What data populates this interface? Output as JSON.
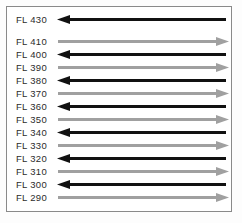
{
  "figure": {
    "name": "flight-level-direction-diagram",
    "frame_border_color": "#8a8a8a",
    "background_color": "#ffffff"
  },
  "colors": {
    "westbound_black": "#111111",
    "eastbound_gray": "#a0a0a0",
    "label_text": "#2b2b2b"
  },
  "legend": {
    "black_arrow_meaning": "arrow-pointing-left",
    "gray_arrow_meaning": "arrow-pointing-right"
  },
  "chart_data": {
    "type": "diagram",
    "title": "",
    "xlabel": "",
    "ylabel": "",
    "rows": [
      {
        "label": "FL 430",
        "direction": "left",
        "color": "#111111",
        "gap_below": true
      },
      {
        "label": "FL 410",
        "direction": "right",
        "color": "#a0a0a0",
        "gap_below": false
      },
      {
        "label": "FL 400",
        "direction": "left",
        "color": "#111111",
        "gap_below": false
      },
      {
        "label": "FL 390",
        "direction": "right",
        "color": "#a0a0a0",
        "gap_below": false
      },
      {
        "label": "FL 380",
        "direction": "left",
        "color": "#111111",
        "gap_below": false
      },
      {
        "label": "FL 370",
        "direction": "right",
        "color": "#a0a0a0",
        "gap_below": false
      },
      {
        "label": "FL 360",
        "direction": "left",
        "color": "#111111",
        "gap_below": false
      },
      {
        "label": "FL 350",
        "direction": "right",
        "color": "#a0a0a0",
        "gap_below": false
      },
      {
        "label": "FL 340",
        "direction": "left",
        "color": "#111111",
        "gap_below": false
      },
      {
        "label": "FL 330",
        "direction": "right",
        "color": "#a0a0a0",
        "gap_below": false
      },
      {
        "label": "FL 320",
        "direction": "left",
        "color": "#111111",
        "gap_below": false
      },
      {
        "label": "FL 310",
        "direction": "right",
        "color": "#a0a0a0",
        "gap_below": false
      },
      {
        "label": "FL 300",
        "direction": "left",
        "color": "#111111",
        "gap_below": false
      },
      {
        "label": "FL 290",
        "direction": "right",
        "color": "#a0a0a0",
        "gap_below": false
      }
    ]
  }
}
